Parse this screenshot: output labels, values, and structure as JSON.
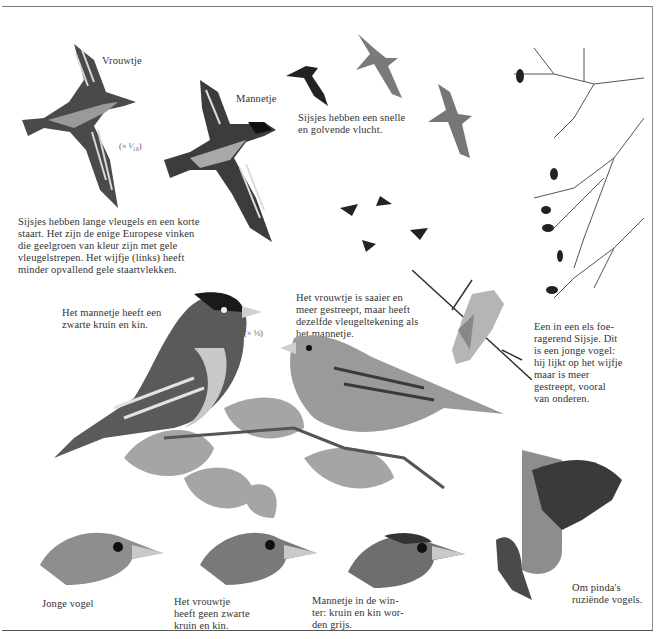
{
  "page": {
    "frame": {
      "line_color": "#7a7a7a"
    }
  },
  "flight_section": {
    "female_label": "Vrouwtje",
    "male_label": "Mannetje",
    "scale_label": "(× ¹⁄₁₀)",
    "flight_caption": "Sijsjes hebben een snelle\nen golvende vlucht.",
    "wings_caption": "Sijsjes hebben lange vleugels en een korte\nstaart. Het zijn de enige Europese vinken\ndie geelgroen van kleur zijn met gele\nvleugelstrepen. Het wijfje (links) heeft\nminder opvallend gele staartvlekken."
  },
  "perched_section": {
    "male_caption": "Het mannetje heeft een\nzwarte kruin en kin.",
    "scale_label": "(× ⅓)",
    "female_caption": "Het vrouwtje is saaier en\nmeer gestreept, maar heeft\ndezelfde vleugeltekening als\nhet mannetje."
  },
  "alder_section": {
    "caption": "Een in een els foe-\nragerend Sijsje. Dit\nis een jonge vogel:\nhij lijkt op het wijfje\nmaar is meer\ngestreept, vooral\nvan onderen."
  },
  "heads_section": {
    "items": [
      {
        "caption": "Jonge vogel"
      },
      {
        "caption": "Het vrouwtje\nheeft geen zwarte\nkruin en kin."
      },
      {
        "caption": "Mannetje in de win-\nter: kruin en kin wor-\nden grijs."
      }
    ]
  },
  "feeder_section": {
    "caption": "Om pinda's\nruziënde vogels."
  }
}
